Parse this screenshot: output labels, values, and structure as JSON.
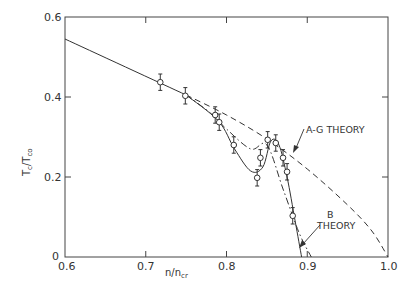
{
  "chart_data": {
    "type": "line",
    "title": "",
    "xlabel": "n/n_cr",
    "ylabel": "Tc/Tco",
    "xlim": [
      0.6,
      1.0
    ],
    "ylim": [
      0,
      0.6
    ],
    "grid": false,
    "x_ticks": [
      "0.6",
      "0.7",
      "0.8",
      "0.9",
      "1.0"
    ],
    "y_ticks": [
      "0",
      "0.2",
      "0.4",
      "0.6"
    ],
    "annotations": [
      {
        "text": "A-G THEORY",
        "points_to": "dashed curve"
      },
      {
        "text": "B THEORY",
        "points_to": "dash-dot curve"
      }
    ],
    "series": [
      {
        "name": "Experimental data",
        "style": "open circles with error bars",
        "x": [
          0.718,
          0.749,
          0.786,
          0.791,
          0.809,
          0.838,
          0.842,
          0.851,
          0.861,
          0.87,
          0.875,
          0.882
        ],
        "y": [
          0.437,
          0.403,
          0.355,
          0.337,
          0.28,
          0.198,
          0.248,
          0.293,
          0.285,
          0.248,
          0.213,
          0.103
        ],
        "yerr": 0.018
      },
      {
        "name": "Common solid line",
        "style": "solid",
        "x": [
          0.6,
          0.75
        ],
        "y": [
          0.545,
          0.405
        ]
      },
      {
        "name": "A-G THEORY",
        "style": "dashed",
        "x": [
          0.75,
          0.8,
          0.85,
          0.9,
          0.95,
          0.98,
          1.0
        ],
        "y": [
          0.405,
          0.355,
          0.295,
          0.22,
          0.13,
          0.065,
          0.0
        ]
      },
      {
        "name": "B THEORY",
        "style": "dash-dot",
        "x": [
          0.75,
          0.78,
          0.8,
          0.83,
          0.85,
          0.87,
          0.89,
          0.905
        ],
        "y": [
          0.405,
          0.36,
          0.32,
          0.27,
          0.28,
          0.17,
          0.06,
          0.0
        ]
      },
      {
        "name": "Solid fit through data",
        "style": "solid",
        "x": [
          0.75,
          0.79,
          0.81,
          0.83,
          0.845,
          0.855,
          0.865,
          0.875,
          0.885,
          0.893
        ],
        "y": [
          0.405,
          0.34,
          0.27,
          0.215,
          0.225,
          0.29,
          0.28,
          0.2,
          0.09,
          0.0
        ]
      }
    ]
  },
  "labels": {
    "x_axis": "n/n",
    "x_axis_sub": "cr",
    "y_axis_main": "T",
    "y_axis_sub1": "c",
    "y_axis_sep": "/T",
    "y_axis_sub2": "co",
    "ag_theory": "A-G THEORY",
    "b_theory_1": "B",
    "b_theory_2": "THEORY",
    "x_ticks": [
      "0.6",
      "0.7",
      "0.8",
      "0.9",
      "1.0"
    ],
    "y_ticks": [
      "0",
      "0.2",
      "0.4",
      "0.6"
    ]
  }
}
